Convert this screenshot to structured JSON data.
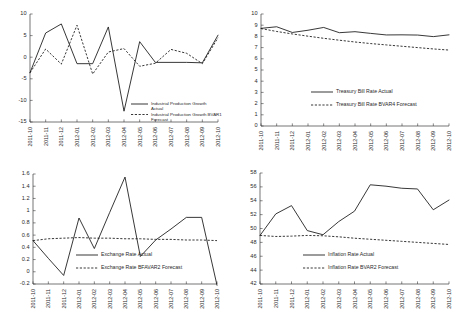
{
  "figure": {
    "title": "",
    "panel_count": 4,
    "layout": "2x2"
  },
  "categories": [
    "2011-10",
    "2011-11",
    "2011-12",
    "2012-01",
    "2012-02",
    "2012-03",
    "2012-04",
    "2012-05",
    "2012-06",
    "2012-07",
    "2012-08",
    "2012-09",
    "2012-10"
  ],
  "chart_data": [
    {
      "id": "industrial-production-growth",
      "type": "line",
      "title": "",
      "xlabel": "",
      "ylabel": "",
      "ylim": [
        -15,
        10
      ],
      "yticks": [
        10,
        5,
        0,
        -5,
        -10,
        -15
      ],
      "ytick_labels": [
        "10",
        "5",
        "0",
        "-5",
        "-10",
        "-15"
      ],
      "grid": false,
      "legend_position": "bottom-right",
      "x": [
        "2011-10",
        "2011-11",
        "2011-12",
        "2012-01",
        "2012-02",
        "2012-03",
        "2012-04",
        "2012-05",
        "2012-06",
        "2012-07",
        "2012-08",
        "2012-09",
        "2012-10"
      ],
      "series": [
        {
          "name": "Industrial Production Growth Actual",
          "style": "solid",
          "values": [
            -3.6,
            5.6,
            7.7,
            -1.5,
            -1.5,
            7.0,
            -12.5,
            3.6,
            -1.2,
            -1.2,
            -1.2,
            -1.3,
            5.1
          ]
        },
        {
          "name": "Industrial Production Growth BVAR1 Forecast",
          "style": "dashed",
          "values": [
            -3.6,
            1.9,
            -1.6,
            7.4,
            -3.9,
            1.2,
            2.0,
            -2.1,
            -1.4,
            1.8,
            0.9,
            -1.5,
            4.5
          ]
        }
      ]
    },
    {
      "id": "treasury-bill-rate",
      "type": "line",
      "title": "",
      "xlabel": "",
      "ylabel": "",
      "ylim": [
        0,
        10
      ],
      "yticks": [
        10,
        9,
        8,
        7,
        6,
        5,
        4,
        3,
        2,
        1,
        0
      ],
      "ytick_labels": [
        "10",
        "9",
        "8",
        "7",
        "6",
        "5",
        "4",
        "3",
        "2",
        "1",
        "0"
      ],
      "grid": false,
      "legend_position": "center-right",
      "x": [
        "2011-10",
        "2011-11",
        "2011-12",
        "2012-01",
        "2012-02",
        "2012-03",
        "2012-04",
        "2012-05",
        "2012-06",
        "2012-07",
        "2012-08",
        "2012-09",
        "2012-10"
      ],
      "series": [
        {
          "name": "Treasury Bill Rate Actual",
          "style": "solid",
          "values": [
            8.72,
            8.86,
            8.35,
            8.55,
            8.8,
            8.33,
            8.42,
            8.27,
            8.13,
            8.14,
            8.12,
            7.98,
            8.14
          ]
        },
        {
          "name": "Treasury Bill Rate BVAR4 Forecast",
          "style": "dashed",
          "values": [
            8.7,
            8.44,
            8.22,
            8.02,
            7.83,
            7.66,
            7.5,
            7.36,
            7.24,
            7.12,
            7.0,
            6.88,
            6.78
          ]
        }
      ]
    },
    {
      "id": "exchange-rate",
      "type": "line",
      "title": "",
      "xlabel": "",
      "ylabel": "",
      "ylim": [
        -0.2,
        1.6
      ],
      "yticks": [
        1.6,
        1.4,
        1.2,
        1,
        0.8,
        0.6,
        0.4,
        0.2,
        0,
        -0.2
      ],
      "ytick_labels": [
        "1.6",
        "1.4",
        "1.2",
        "1",
        "0.8",
        "0.6",
        "0.4",
        "0.2",
        "0",
        "-0.2"
      ],
      "grid": false,
      "legend_position": "bottom-center",
      "x": [
        "2011-10",
        "2011-11",
        "2011-12",
        "2012-01",
        "2012-02",
        "2012-03",
        "2012-04",
        "2012-05",
        "2012-06",
        "2012-07",
        "2012-08",
        "2012-09",
        "2012-10"
      ],
      "series": [
        {
          "name": "Exchange Rate Actual",
          "style": "solid",
          "values": [
            0.51,
            0.22,
            -0.06,
            0.88,
            0.38,
            0.97,
            1.55,
            0.25,
            0.52,
            0.7,
            0.89,
            0.89,
            -0.22
          ]
        },
        {
          "name": "Exchange Rate BFAVAR2 Forecast",
          "style": "dashed",
          "values": [
            0.51,
            0.54,
            0.55,
            0.56,
            0.55,
            0.55,
            0.54,
            0.54,
            0.53,
            0.53,
            0.52,
            0.52,
            0.51
          ]
        }
      ]
    },
    {
      "id": "inflation-rate",
      "type": "line",
      "title": "",
      "xlabel": "",
      "ylabel": "",
      "ylim": [
        42,
        58
      ],
      "yticks": [
        58,
        56,
        54,
        52,
        50,
        48,
        46,
        44,
        42
      ],
      "ytick_labels": [
        "58",
        "56",
        "54",
        "52",
        "50",
        "48",
        "46",
        "44",
        "42"
      ],
      "grid": false,
      "legend_position": "bottom-center",
      "x": [
        "2011-10",
        "2011-11",
        "2011-12",
        "2012-01",
        "2012-02",
        "2012-03",
        "2012-04",
        "2012-05",
        "2012-06",
        "2012-07",
        "2012-08",
        "2012-09",
        "2012-10"
      ],
      "series": [
        {
          "name": "Inflation Rate Actual",
          "style": "solid",
          "values": [
            49.0,
            52.1,
            53.3,
            49.7,
            49.1,
            51.0,
            52.5,
            56.3,
            56.1,
            55.8,
            55.7,
            52.7,
            54.1
          ]
        },
        {
          "name": "Inflation Rate BVAR2 Forecast",
          "style": "dashed",
          "values": [
            49.0,
            48.85,
            48.9,
            49.0,
            48.95,
            48.8,
            48.6,
            48.45,
            48.3,
            48.15,
            48.0,
            47.85,
            47.7
          ]
        }
      ]
    }
  ]
}
